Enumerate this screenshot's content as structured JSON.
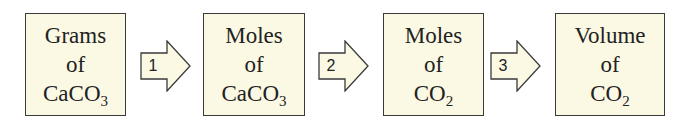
{
  "diagram": {
    "colors": {
      "box_fill": "#fbf9e4",
      "border": "#3a3a3a",
      "text": "#222222"
    },
    "boxes": [
      {
        "line1": "Grams",
        "line2": "of",
        "line3_main": "CaCO",
        "line3_sub": "3"
      },
      {
        "line1": "Moles",
        "line2": "of",
        "line3_main": "CaCO",
        "line3_sub": "3"
      },
      {
        "line1": "Moles",
        "line2": "of",
        "line3_main": "CO",
        "line3_sub": "2"
      },
      {
        "line1": "Volume",
        "line2": "of",
        "line3_main": "CO",
        "line3_sub": "2"
      }
    ],
    "arrows": [
      {
        "step": "1"
      },
      {
        "step": "2"
      },
      {
        "step": "3"
      }
    ]
  }
}
